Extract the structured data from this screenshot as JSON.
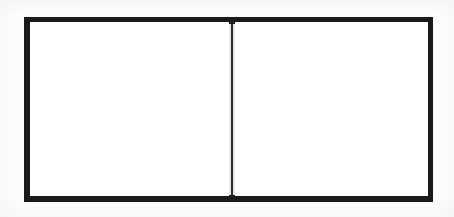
{
  "figure": {
    "medium": "scanned line drawing",
    "background_color": "#fdfdfd"
  },
  "canvas": {
    "width": 454,
    "height": 217
  },
  "outer_rect": {
    "name": "outer rectangle",
    "x": 24,
    "y": 17,
    "width": 409,
    "height": 185,
    "stroke_color": "#1a1a1a",
    "stroke_width": 6,
    "fill_color": "#ffffff"
  },
  "divider": {
    "name": "vertical divider",
    "orientation": "vertical",
    "x": 231,
    "y_start": 17,
    "y_end": 202,
    "stroke_color": "#2b2b2b",
    "stroke_width": 2
  },
  "panels": [
    {
      "id": "left",
      "label": "",
      "x": 30,
      "y": 22,
      "width": 201,
      "height": 174,
      "fill_color": "#ffffff",
      "content": ""
    },
    {
      "id": "right",
      "label": "",
      "x": 233,
      "y": 22,
      "width": 195,
      "height": 174,
      "fill_color": "#ffffff",
      "content": ""
    }
  ]
}
